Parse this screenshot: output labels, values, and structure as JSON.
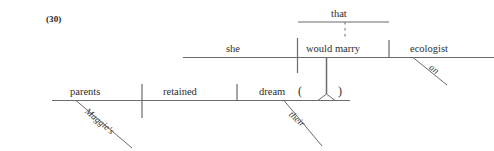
{
  "example": {
    "number": "(30)"
  },
  "diagram": {
    "type": "reed-kellogg-sentence-diagram",
    "line_color": "#6b6b6b",
    "text_color": "#2e2e2e",
    "main_clause": {
      "subject": "parents",
      "subject_modifier": "Maggie's",
      "verb": "retained",
      "object": "dream",
      "object_modifier": "their",
      "placeholder_open": "(",
      "placeholder_close": ")"
    },
    "subordinate_clause": {
      "complementizer": "that",
      "subject": "she",
      "verb": "would marry",
      "object": "ecologist",
      "object_modifier": "an"
    }
  }
}
